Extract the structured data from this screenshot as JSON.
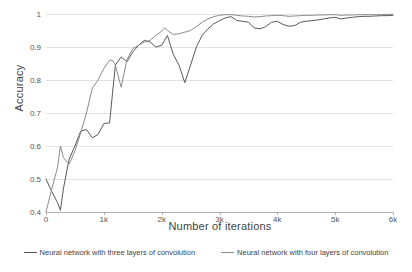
{
  "chart_data": {
    "type": "line",
    "title": "",
    "xlabel": "Number of iterations",
    "ylabel": "Accuracy",
    "xlim": [
      0,
      6000
    ],
    "ylim": [
      0.4,
      1.0
    ],
    "grid": true,
    "legend_position": "bottom",
    "x_ticks": [
      "0",
      "1k",
      "2k",
      "3k",
      "4k",
      "5k",
      "6k"
    ],
    "x_tick_values": [
      0,
      1000,
      2000,
      3000,
      4000,
      5000,
      6000
    ],
    "y_ticks": [
      "0.4",
      "0.5",
      "0.6",
      "0.7",
      "0.8",
      "0.9",
      "1"
    ],
    "y_tick_values": [
      0.4,
      0.5,
      0.6,
      0.7,
      0.8,
      0.9,
      1.0
    ],
    "x": [
      0,
      100,
      200,
      250,
      300,
      400,
      500,
      600,
      700,
      800,
      900,
      1000,
      1100,
      1150,
      1200,
      1300,
      1400,
      1500,
      1600,
      1700,
      1800,
      1900,
      2000,
      2050,
      2100,
      2200,
      2300,
      2400,
      2500,
      2600,
      2700,
      2800,
      2900,
      3000,
      3100,
      3200,
      3300,
      3400,
      3500,
      3600,
      3700,
      3800,
      3900,
      4000,
      4100,
      4200,
      4300,
      4400,
      4500,
      4600,
      4700,
      4800,
      4900,
      5000,
      5100,
      5200,
      5300,
      5400,
      5500,
      5600,
      5700,
      5800,
      5900,
      6000
    ],
    "series": [
      {
        "name": "Neural network with three layers of convolution",
        "color": "#58595b",
        "values": [
          0.5,
          0.462,
          0.428,
          0.405,
          0.47,
          0.56,
          0.6,
          0.645,
          0.65,
          0.625,
          0.635,
          0.668,
          0.67,
          0.76,
          0.845,
          0.87,
          0.855,
          0.885,
          0.905,
          0.92,
          0.915,
          0.9,
          0.905,
          0.92,
          0.935,
          0.878,
          0.845,
          0.792,
          0.845,
          0.9,
          0.935,
          0.955,
          0.97,
          0.98,
          0.988,
          0.992,
          0.98,
          0.978,
          0.975,
          0.958,
          0.955,
          0.962,
          0.975,
          0.978,
          0.968,
          0.963,
          0.965,
          0.975,
          0.978,
          0.98,
          0.982,
          0.985,
          0.988,
          0.99,
          0.985,
          0.988,
          0.99,
          0.992,
          0.993,
          0.993,
          0.994,
          0.995,
          0.995,
          0.996
        ]
      },
      {
        "name": "Neural network with four layers of convolution",
        "color": "#8c8c8e",
        "values": [
          0.4,
          0.47,
          0.535,
          0.6,
          0.565,
          0.545,
          0.585,
          0.64,
          0.7,
          0.775,
          0.8,
          0.835,
          0.86,
          0.86,
          0.845,
          0.778,
          0.862,
          0.895,
          0.905,
          0.915,
          0.92,
          0.935,
          0.948,
          0.958,
          0.95,
          0.938,
          0.94,
          0.945,
          0.95,
          0.962,
          0.975,
          0.985,
          0.992,
          0.996,
          0.998,
          0.998,
          0.996,
          0.994,
          0.993,
          0.991,
          0.992,
          0.994,
          0.995,
          0.996,
          0.995,
          0.993,
          0.994,
          0.995,
          0.996,
          0.996,
          0.997,
          0.997,
          0.998,
          0.998,
          0.996,
          0.997,
          0.997,
          0.998,
          0.998,
          0.998,
          0.998,
          0.998,
          0.999,
          0.999
        ]
      }
    ]
  },
  "legend": {
    "items": [
      {
        "label": "Neural network with three layers of convolution",
        "color": "#58595b"
      },
      {
        "label": "Neural network with four layers of convolution",
        "color": "#8c8c8e"
      }
    ]
  },
  "colors": {
    "gridline": "#e2e2e2",
    "axis": "#b4b4b4",
    "text": "#3f3f3f",
    "background": "#ffffff"
  }
}
